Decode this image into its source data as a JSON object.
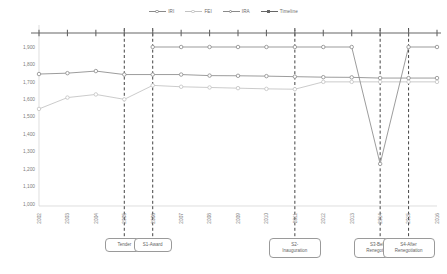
{
  "chart_data": {
    "type": "line",
    "title": "",
    "xlabel": "",
    "ylabel": "",
    "grid": false,
    "legend_position": "top-center",
    "categories": [
      "2002",
      "2003",
      "2004",
      "2005",
      "2006",
      "2007",
      "2008",
      "2009",
      "2010",
      "2011",
      "2012",
      "2013",
      "2014",
      "2015",
      "2016"
    ],
    "ylim": [
      1000,
      1900
    ],
    "yticks": [
      "1,000",
      "1,100",
      "1,200",
      "1,300",
      "1,400",
      "1,500",
      "1,600",
      "1,700",
      "1,800",
      "1,900"
    ],
    "ytick_values": [
      1000,
      1100,
      1200,
      1300,
      1400,
      1500,
      1600,
      1700,
      1800,
      1900
    ],
    "series": [
      {
        "name": "IRI",
        "color": "#8a8a8a",
        "x": [
          "2002",
          "2003",
          "2004",
          "2005",
          "2006",
          "2007",
          "2008",
          "2009",
          "2010",
          "2011",
          "2012",
          "2013",
          "2014",
          "2015",
          "2016"
        ],
        "values": [
          1745,
          1750,
          1762,
          1742,
          1742,
          1742,
          1736,
          1735,
          1733,
          1730,
          1727,
          1726,
          1722,
          1722,
          1722
        ]
      },
      {
        "name": "FEI",
        "color": "#c2c2c2",
        "x": [
          "2002",
          "2003",
          "2004",
          "2005",
          "2006",
          "2007",
          "2008",
          "2009",
          "2010",
          "2011",
          "2012",
          "2013",
          "2014",
          "2015",
          "2016"
        ],
        "values": [
          1545,
          1610,
          1628,
          1600,
          1680,
          1672,
          1668,
          1664,
          1660,
          1658,
          1700,
          1700,
          1700,
          1700,
          1700
        ]
      },
      {
        "name": "IRA",
        "color": "#8a8a8a",
        "x": [
          "2006",
          "2007",
          "2008",
          "2009",
          "2010",
          "2011",
          "2012",
          "2013",
          "2014",
          "2015",
          "2016"
        ],
        "values": [
          1900,
          1900,
          1900,
          1900,
          1900,
          1900,
          1900,
          1900,
          1230,
          1900,
          1900
        ]
      }
    ],
    "timeline": {
      "name": "Timeline",
      "color": "#666666",
      "value": 1985,
      "ticks": [
        "2002",
        "2003",
        "2004",
        "2005",
        "2006",
        "2007",
        "2008",
        "2009",
        "2010",
        "2011",
        "2012",
        "2013",
        "2014",
        "2015",
        "2016"
      ]
    },
    "event_lines": [
      {
        "x": "2005",
        "style": "dashed"
      },
      {
        "x": "2006",
        "style": "dashed"
      },
      {
        "x": "2011",
        "style": "dashed"
      },
      {
        "x": "2014",
        "style": "dashed"
      },
      {
        "x": "2015",
        "style": "dashed"
      }
    ],
    "annotations": [
      {
        "x": "2005",
        "label": "Tender",
        "lines": [
          "Tender"
        ]
      },
      {
        "x": "2006",
        "label": "S1-Award",
        "lines": [
          "S1-Award"
        ]
      },
      {
        "x": "2011",
        "label": "S2-Inauguration",
        "lines": [
          "S2-",
          "Inauguration"
        ]
      },
      {
        "x": "2014",
        "label": "S3-Before Renegotiation",
        "lines": [
          "S3-Before",
          "Renegotiation"
        ]
      },
      {
        "x": "2015",
        "label": "S4-After Renegotiation",
        "lines": [
          "S4-After",
          "Renegotiation"
        ]
      }
    ]
  },
  "legend": {
    "items": [
      {
        "label": "IRI",
        "color": "#8a8a8a",
        "marker": "circle"
      },
      {
        "label": "FEI",
        "color": "#c2c2c2",
        "marker": "circle"
      },
      {
        "label": "IRA",
        "color": "#8a8a8a",
        "marker": "circle"
      },
      {
        "label": "Timeline",
        "color": "#666666",
        "marker": "square"
      }
    ]
  }
}
